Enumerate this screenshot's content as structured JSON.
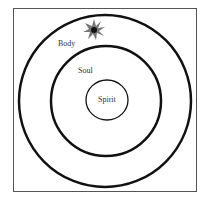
{
  "diagram": {
    "labels": {
      "outer": "Body",
      "middle": "Soul",
      "inner": "Spirit"
    },
    "colors": {
      "stroke": "#111111",
      "frame": "#555555",
      "burst": "#666666",
      "burst_core": "#111111"
    }
  }
}
